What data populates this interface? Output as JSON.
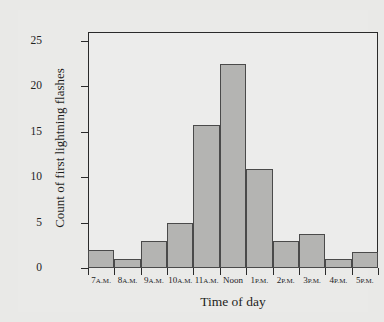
{
  "chart_data": {
    "type": "bar",
    "title": "",
    "xlabel": "Time of day",
    "ylabel": "Count of first lightning flashes",
    "categories": [
      "7 A.M.",
      "8 A.M.",
      "9 A.M.",
      "10 A.M.",
      "11 A.M.",
      "Noon",
      "1 P.M.",
      "2 P.M.",
      "3 P.M.",
      "4 P.M.",
      "5 P.M."
    ],
    "category_parts": [
      {
        "num": "7",
        "suffix": "A.M."
      },
      {
        "num": "8",
        "suffix": "A.M."
      },
      {
        "num": "9",
        "suffix": "A.M."
      },
      {
        "num": "10",
        "suffix": "A.M."
      },
      {
        "num": "11",
        "suffix": "A.M."
      },
      {
        "num": "Noon",
        "suffix": ""
      },
      {
        "num": "1",
        "suffix": "P.M."
      },
      {
        "num": "2",
        "suffix": "P.M."
      },
      {
        "num": "3",
        "suffix": "P.M."
      },
      {
        "num": "4",
        "suffix": "P.M."
      },
      {
        "num": "5",
        "suffix": "P.M."
      }
    ],
    "values": [
      2,
      1,
      3,
      5,
      15.8,
      22.5,
      10.9,
      3,
      3.8,
      1,
      1.8
    ],
    "ylim": [
      0,
      26
    ],
    "yticks": [
      0,
      5,
      10,
      15,
      20,
      25
    ],
    "ytick_labels": [
      "0",
      "5",
      "10",
      "15",
      "20",
      "25"
    ],
    "grid": false,
    "legend": "none",
    "bar_fill_color": "#b4b4b2",
    "bar_edge_color": "#4a4a4a",
    "axis_color": "#2a2a2a",
    "plot_background": "#ececeb",
    "figure_background": "#e9e9e7"
  }
}
